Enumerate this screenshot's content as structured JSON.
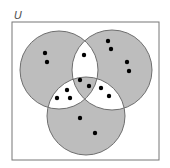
{
  "universe": {
    "label": "U",
    "rect": {
      "x": 12,
      "y": 22,
      "w": 147,
      "h": 138
    },
    "stroke": "#777777"
  },
  "colors": {
    "shaded": "#bdbdbd",
    "unshaded": "#ffffff",
    "circle_stroke": "#6e6e6e",
    "dot": "#000000"
  },
  "circles": [
    {
      "name": "A",
      "cx": 59,
      "cy": 70,
      "r": 39
    },
    {
      "name": "B",
      "cx": 112,
      "cy": 70,
      "r": 40
    },
    {
      "name": "C",
      "cx": 86,
      "cy": 116,
      "r": 39
    }
  ],
  "regions": {
    "A_only": {
      "shaded": true,
      "count": 2
    },
    "B_only": {
      "shaded": true,
      "count": 4
    },
    "C_only": {
      "shaded": true,
      "count": 2
    },
    "A_and_B_only": {
      "shaded": false,
      "count": 1
    },
    "A_and_C_only": {
      "shaded": false,
      "count": 4
    },
    "B_and_C_only": {
      "shaded": false,
      "count": 2
    },
    "A_and_B_and_C": {
      "shaded": true,
      "count": 2
    }
  },
  "dots": [
    {
      "x": 45,
      "y": 53
    },
    {
      "x": 47,
      "y": 62
    },
    {
      "x": 108,
      "y": 41
    },
    {
      "x": 111,
      "y": 49
    },
    {
      "x": 127,
      "y": 62
    },
    {
      "x": 129,
      "y": 71
    },
    {
      "x": 84,
      "y": 55
    },
    {
      "x": 80,
      "y": 80
    },
    {
      "x": 89,
      "y": 86
    },
    {
      "x": 67,
      "y": 90
    },
    {
      "x": 57,
      "y": 98
    },
    {
      "x": 70,
      "y": 98
    },
    {
      "x": 80,
      "y": 118
    },
    {
      "x": 101,
      "y": 88
    },
    {
      "x": 109,
      "y": 96
    },
    {
      "x": 95,
      "y": 133
    }
  ]
}
